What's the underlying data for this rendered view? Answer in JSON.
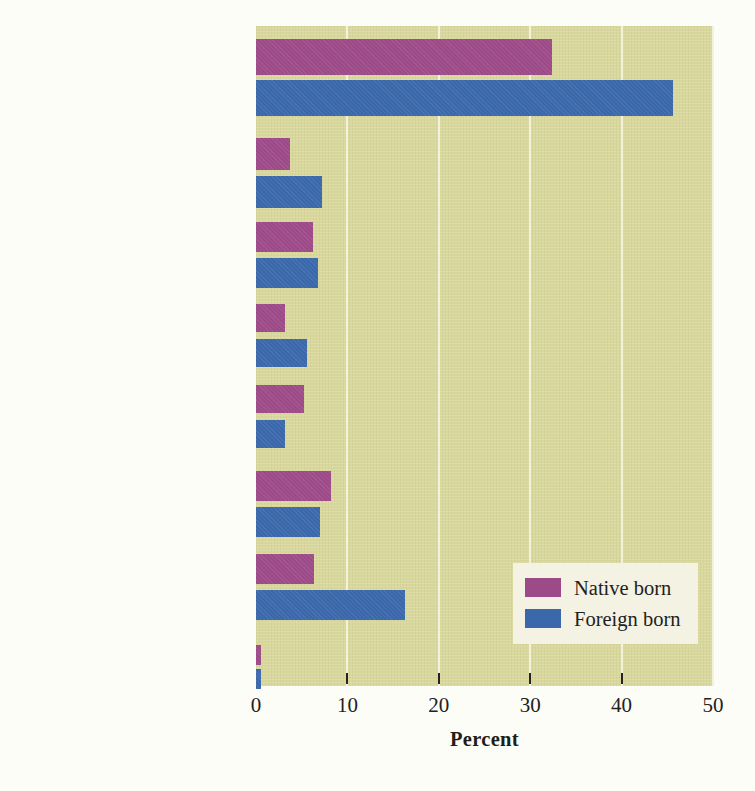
{
  "chart_data": {
    "type": "bar",
    "orientation": "horizontal",
    "title": "",
    "xlabel": "Percent",
    "ylabel": "",
    "xlim": [
      0,
      50
    ],
    "xticks": [
      0,
      10,
      20,
      30,
      40,
      50
    ],
    "xtick_labels": [
      "0",
      "10",
      "20",
      "30",
      "40",
      "50"
    ],
    "grid": true,
    "grid_axis": "x",
    "legend_position": "inside-right",
    "categories": [
      "All science and\nengineering fields",
      "Computers,\nmathematics\nand statistics",
      "Biological,\nagricultural, and\nenvironmental sciences",
      "Physical and\nrelated sciences",
      "Psychology",
      "Social sciences",
      "Engineering",
      "Multidisciplinary\nsciences"
    ],
    "series": [
      {
        "name": "Native born",
        "color": "#9c4a88",
        "values": [
          32.4,
          3.7,
          6.2,
          3.2,
          5.3,
          8.2,
          6.3,
          0.5
        ]
      },
      {
        "name": "Foreign born",
        "color": "#3a68ab",
        "values": [
          45.6,
          7.2,
          6.8,
          5.6,
          3.2,
          7.0,
          16.3,
          0.5
        ]
      }
    ]
  },
  "legend": {
    "items": [
      {
        "label": "Native born",
        "swatch": "native"
      },
      {
        "label": "Foreign born",
        "swatch": "foreign"
      }
    ]
  },
  "colors": {
    "plot_background": "#d9d89c",
    "gridline": "#f2f1dc",
    "legend_background": "#f4f2e2",
    "native_born": "#9c4a88",
    "foreign_born": "#3a68ab",
    "text": "#22211c"
  }
}
